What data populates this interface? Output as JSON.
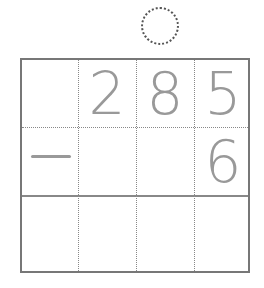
{
  "worksheet": {
    "carry_box": "",
    "operation": "subtraction",
    "operator": "−",
    "rows": [
      {
        "cells": [
          "",
          "2",
          "8",
          "5"
        ]
      },
      {
        "cells": [
          "−",
          "",
          "",
          "6"
        ]
      },
      {
        "cells": [
          "",
          "",
          "",
          ""
        ]
      }
    ],
    "minuend": "285",
    "subtrahend": "6",
    "answer": "",
    "colors": {
      "digits": "#999999",
      "grid_border": "#777777",
      "grid_dotted": "#888888"
    }
  }
}
